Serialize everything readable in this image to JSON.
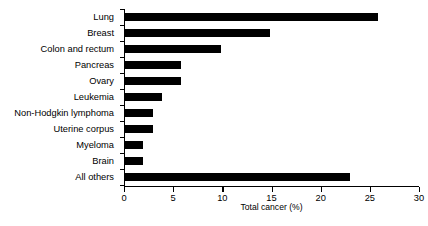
{
  "chart_data": {
    "type": "bar",
    "orientation": "horizontal",
    "title": "",
    "xlabel": "Total cancer (%)",
    "ylabel": "",
    "xlim": [
      0,
      30
    ],
    "xticks": [
      0,
      5,
      10,
      15,
      20,
      25,
      30
    ],
    "xtick_labels": [
      "0",
      "5",
      "10",
      "15",
      "20",
      "25",
      "30"
    ],
    "grid": false,
    "legend": false,
    "bar_color": "#000000",
    "categories": [
      "Lung",
      "Breast",
      "Colon and rectum",
      "Pancreas",
      "Ovary",
      "Leukemia",
      "Non-Hodgkin lymphoma",
      "Uterine corpus",
      "Myeloma",
      "Brain",
      "All others"
    ],
    "values": [
      25.8,
      14.8,
      9.9,
      5.8,
      5.8,
      3.9,
      2.9,
      2.9,
      1.9,
      1.9,
      23.0
    ]
  }
}
